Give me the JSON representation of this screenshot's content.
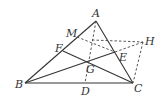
{
  "diagram": {
    "type": "geometry-triangle",
    "points": {
      "A": {
        "label": "A",
        "x": 96,
        "y": 21
      },
      "B": {
        "label": "B",
        "x": 25,
        "y": 83
      },
      "C": {
        "label": "C",
        "x": 133,
        "y": 83
      },
      "D": {
        "label": "D",
        "x": 85,
        "y": 83
      },
      "E": {
        "label": "E",
        "x": 115,
        "y": 52
      },
      "F": {
        "label": "F",
        "x": 63,
        "y": 51
      },
      "G": {
        "label": "G",
        "x": 87,
        "y": 61
      },
      "H": {
        "label": "H",
        "x": 143,
        "y": 42
      },
      "M": {
        "label": "M",
        "x": 77,
        "y": 37
      }
    },
    "solid_segments": [
      "AB",
      "AC",
      "BC",
      "BE",
      "FC"
    ],
    "dashed_segments": [
      "AD",
      "ME",
      "MH-part",
      "EH",
      "HC"
    ],
    "colors": {
      "stroke": "#333333",
      "background": "#ffffff"
    }
  }
}
